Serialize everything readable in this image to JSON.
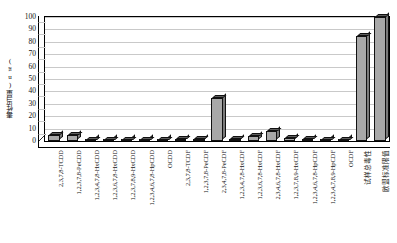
{
  "chart_data": {
    "type": "bar",
    "title": "",
    "subtitle": "",
    "xlabel": "",
    "ylabel": "毒性当量(ng)",
    "ylim": [
      0,
      100
    ],
    "ytick_step": 10,
    "yticks": [
      100,
      90,
      80,
      70,
      60,
      50,
      40,
      30,
      20,
      10,
      0
    ],
    "grid": true,
    "legend": false,
    "legend_position": "none",
    "series_name": "毒性当量",
    "bar_color": "#a8a8a8",
    "bar_border_color": "#111111",
    "categories": [
      "2,3,7,8-TCDD",
      "1,2,3,7,8-PeCDD",
      "1,2,3,4,7,8-HxCDD",
      "1,2,3,6,7,8-HxCDD",
      "1,2,3,7,8,9-HxCDD",
      "1,2,3,4,6,7,8-HpCDD",
      "OCDD",
      "2,3,7,8-TCDF",
      "1,2,3,7,8-PeCDF",
      "2,3,4,7,8-PeCDF",
      "1,2,3,4,7,8-HxCDF",
      "1,2,3,6,7,8-HxCDF",
      "2,3,4,6,7,8-HxCDF",
      "1,2,3,7,8,9-HxCDF",
      "1,2,3,4,6,7,8-HpCDF",
      "1,2,3,4,7,8,9-HpCDF",
      "OCDF",
      "试样总毒性",
      "欧盟标准限值"
    ],
    "category_is_cjk": [
      false,
      false,
      false,
      false,
      false,
      false,
      false,
      false,
      false,
      false,
      false,
      false,
      false,
      false,
      false,
      false,
      false,
      true,
      true
    ],
    "values": [
      4.5,
      5.0,
      1.2,
      1.2,
      1.2,
      1.0,
      1.0,
      1.5,
      1.5,
      35.0,
      2.0,
      4.0,
      8.0,
      2.5,
      1.5,
      1.2,
      1.0,
      85.0,
      100.0
    ]
  }
}
